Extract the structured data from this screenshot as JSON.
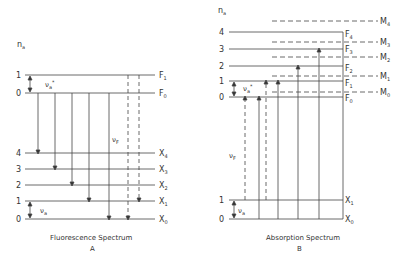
{
  "panelA": {
    "axis_label": "n",
    "axis_sub": "a",
    "caption": "Fluorescence Spectrum",
    "letter": "A",
    "upper_levels": [
      {
        "n": "1",
        "label": "F",
        "sub": "1",
        "y": 75
      },
      {
        "n": "0",
        "label": "F",
        "sub": "0",
        "y": 93
      }
    ],
    "lower_levels": [
      {
        "n": "4",
        "label": "X",
        "sub": "4",
        "y": 153
      },
      {
        "n": "3",
        "label": "X",
        "sub": "3",
        "y": 169
      },
      {
        "n": "2",
        "label": "X",
        "sub": "2",
        "y": 185
      },
      {
        "n": "1",
        "label": "X",
        "sub": "1",
        "y": 201
      },
      {
        "n": "0",
        "label": "X",
        "sub": "0",
        "y": 219
      }
    ],
    "nu_a_star": "ν",
    "nu_F": "νF",
    "nu_a": "νa"
  },
  "panelB": {
    "axis_label": "n",
    "axis_sub": "a",
    "caption": "Absorption Spectrum",
    "letter": "B",
    "upper_levels": [
      {
        "n": "4",
        "label": "F",
        "sub": "4",
        "y": 32
      },
      {
        "n": "3",
        "label": "F",
        "sub": "3",
        "y": 49
      },
      {
        "n": "2",
        "label": "F",
        "sub": "2",
        "y": 66
      },
      {
        "n": "1",
        "label": "F",
        "sub": "1",
        "y": 81
      },
      {
        "n": "0",
        "label": "F",
        "sub": "0",
        "y": 97
      }
    ],
    "m_levels": [
      {
        "label": "M",
        "sub": "4",
        "y": 21
      },
      {
        "label": "M",
        "sub": "3",
        "y": 42
      },
      {
        "label": "M",
        "sub": "2",
        "y": 57
      },
      {
        "label": "M",
        "sub": "1",
        "y": 76
      },
      {
        "label": "M",
        "sub": "0",
        "y": 92
      }
    ],
    "lower_levels": [
      {
        "n": "1",
        "label": "X",
        "sub": "1",
        "y": 200
      },
      {
        "n": "0",
        "label": "X",
        "sub": "0",
        "y": 219
      }
    ]
  }
}
